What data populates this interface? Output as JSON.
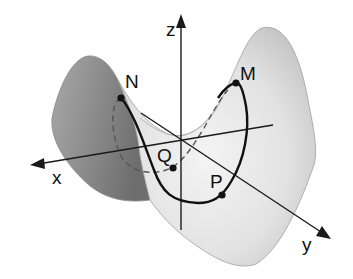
{
  "diagram": {
    "type": "saddle-surface",
    "axes": {
      "x": {
        "label": "x"
      },
      "y": {
        "label": "y"
      },
      "z": {
        "label": "z"
      }
    },
    "points": [
      {
        "id": "N",
        "label": "N"
      },
      {
        "id": "M",
        "label": "M"
      },
      {
        "id": "P",
        "label": "P"
      },
      {
        "id": "Q",
        "label": "Q"
      }
    ],
    "colors": {
      "surface_dark": "#8a8a8a",
      "surface_light": "#e6e6e6",
      "surface_edge": "#9a9a9a",
      "curve": "#111111",
      "axis": "#1a1a1a"
    }
  }
}
